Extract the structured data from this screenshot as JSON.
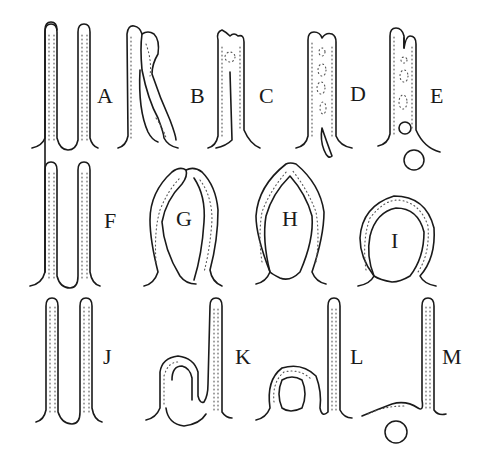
{
  "figure": {
    "panels": [
      {
        "id": "A",
        "label": "A",
        "row": 1
      },
      {
        "id": "B",
        "label": "B",
        "row": 1
      },
      {
        "id": "C",
        "label": "C",
        "row": 1
      },
      {
        "id": "D",
        "label": "D",
        "row": 1
      },
      {
        "id": "E",
        "label": "E",
        "row": 1
      },
      {
        "id": "F",
        "label": "F",
        "row": 2
      },
      {
        "id": "G",
        "label": "G",
        "row": 2
      },
      {
        "id": "H",
        "label": "H",
        "row": 2
      },
      {
        "id": "I",
        "label": "I",
        "row": 2
      },
      {
        "id": "J",
        "label": "J",
        "row": 3
      },
      {
        "id": "K",
        "label": "K",
        "row": 3
      },
      {
        "id": "L",
        "label": "L",
        "row": 3
      },
      {
        "id": "M",
        "label": "M",
        "row": 3
      }
    ],
    "colors": {
      "ink": "#1a1a1a",
      "background": "#ffffff"
    }
  }
}
